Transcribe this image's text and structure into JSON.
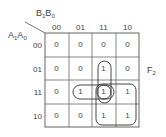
{
  "kmap": {
    "col_var": {
      "main": "B",
      "s1": "1",
      "main2": "B",
      "s2": "0"
    },
    "row_var": {
      "main": "A",
      "s1": "1",
      "main2": "A",
      "s2": "0"
    },
    "col_headers": [
      "00",
      "01",
      "11",
      "10"
    ],
    "row_headers": [
      "00",
      "01",
      "11",
      "10"
    ],
    "cells": [
      [
        "0",
        "0",
        "0",
        "0"
      ],
      [
        "0",
        "0",
        "1",
        "0"
      ],
      [
        "0",
        "1",
        "1",
        "1"
      ],
      [
        "0",
        "0",
        "1",
        "1"
      ]
    ],
    "output_label": {
      "main": "F",
      "sub": "2"
    },
    "groups": [
      {
        "name": "vertical-pair",
        "cells": [
          [
            1,
            2
          ],
          [
            2,
            2
          ]
        ]
      },
      {
        "name": "horizontal-pair",
        "cells": [
          [
            2,
            1
          ],
          [
            2,
            2
          ]
        ]
      },
      {
        "name": "quad",
        "cells": [
          [
            2,
            2
          ],
          [
            2,
            3
          ],
          [
            3,
            2
          ],
          [
            3,
            3
          ]
        ]
      }
    ]
  }
}
